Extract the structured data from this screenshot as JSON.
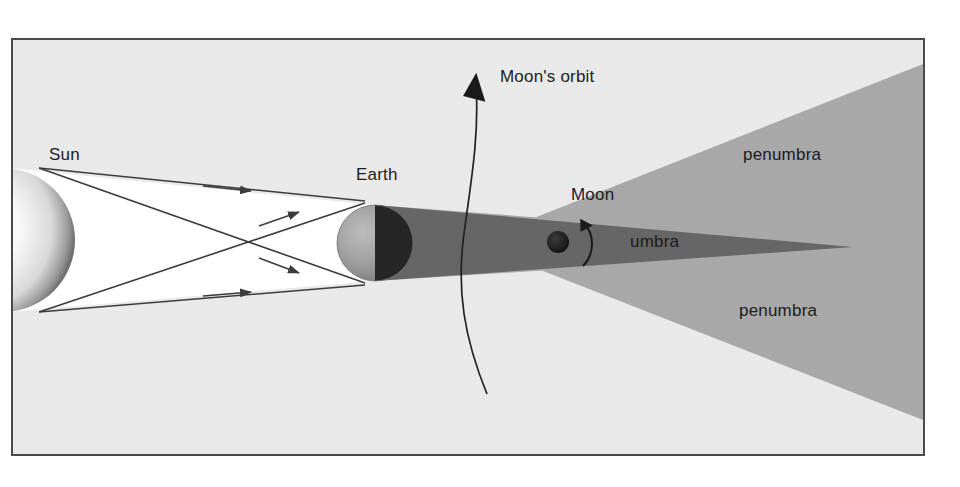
{
  "figure": {
    "background_color": "#e9e9e9",
    "page_color": "#ffffff",
    "border_color": "#4a4a4a"
  },
  "labels": {
    "sun": "Sun",
    "earth": "Earth",
    "moon": "Moon",
    "moons_orbit": "Moon's orbit",
    "umbra": "umbra",
    "penumbra_top": "penumbra",
    "penumbra_bottom": "penumbra"
  },
  "colors": {
    "umbra": "#666666",
    "penumbra": "#a8a8a8",
    "sunlight_cone": "#ffffff",
    "ray_line": "#3c3c3c",
    "earth_lit": "#9a9a9a",
    "earth_dark": "#262626",
    "moon": "#1e1e1e",
    "orbit_line": "#222222",
    "label_text": "#1c1c1c"
  },
  "bodies": {
    "sun": {
      "name": "sun-sphere",
      "center_x": -10,
      "center_y": 200,
      "radius": 72,
      "clipped_left": true
    },
    "earth": {
      "name": "earth-sphere",
      "center_x": 362,
      "center_y": 203,
      "radius": 38,
      "terminator_x": 362
    },
    "moon": {
      "name": "moon-disc",
      "center_x": 545,
      "center_y": 202,
      "radius": 11
    }
  },
  "shadow": {
    "umbra_apex_x": 840,
    "umbra_apex_y": 207,
    "penumbra_top_right_y": 24,
    "penumbra_bottom_right_y": 380
  },
  "orbit": {
    "arrow_tip_x": 461,
    "arrow_tip_y": 35,
    "tail_x": 474,
    "tail_y": 354,
    "direction": "counterclockwise"
  },
  "rays": [
    {
      "name": "ray-top-tangent",
      "from": "sun-top",
      "to": "earth-top"
    },
    {
      "name": "ray-top-cross",
      "from": "sun-top",
      "to": "earth-bottom"
    },
    {
      "name": "ray-bottom-cross",
      "from": "sun-bottom",
      "to": "earth-top"
    },
    {
      "name": "ray-bottom-tangent",
      "from": "sun-bottom",
      "to": "earth-bottom"
    }
  ],
  "diagram_data": {
    "type": "diagram",
    "subject": "lunar eclipse",
    "elements": [
      "Sun",
      "Earth",
      "Moon",
      "umbra",
      "penumbra",
      "Moon's orbit"
    ],
    "description": "Sunlight from the left is blocked by Earth, producing a dark conical umbra and lighter penumbra to the right; the Moon sits within the umbra on its orbital path."
  }
}
